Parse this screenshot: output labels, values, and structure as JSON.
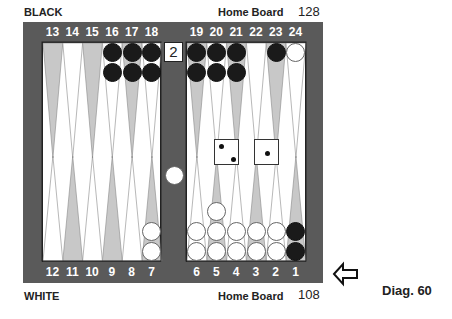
{
  "labels": {
    "top_player": "BLACK",
    "top_home": "Home Board",
    "top_pipcount": "128",
    "bottom_player": "WHITE",
    "bottom_home": "Home Board",
    "bottom_pipcount": "108",
    "diagram": "Diag. 60"
  },
  "colors": {
    "frame": "#5a5a5a",
    "dark_point": "#c8c8c8",
    "light_point": "#ffffff",
    "black": "#1a1a1a",
    "white": "#ffffff"
  },
  "top_numbers": [
    "13",
    "14",
    "15",
    "16",
    "17",
    "18",
    "19",
    "20",
    "21",
    "22",
    "23",
    "24"
  ],
  "bottom_numbers": [
    "12",
    "11",
    "10",
    "9",
    "8",
    "7",
    "6",
    "5",
    "4",
    "3",
    "2",
    "1"
  ],
  "cube": {
    "value": "2",
    "position": "bar-top"
  },
  "dice": [
    2,
    1
  ],
  "bar": {
    "white": 1,
    "black": 0
  },
  "points": {
    "1": {
      "color": "black",
      "count": 2
    },
    "2": {
      "color": "white",
      "count": 2
    },
    "3": {
      "color": "white",
      "count": 2
    },
    "4": {
      "color": "white",
      "count": 2
    },
    "5": {
      "color": "white",
      "count": 3
    },
    "6": {
      "color": "white",
      "count": 2
    },
    "7": {
      "color": "white",
      "count": 2
    },
    "16": {
      "color": "black",
      "count": 2
    },
    "17": {
      "color": "black",
      "count": 2
    },
    "18": {
      "color": "black",
      "count": 2
    },
    "19": {
      "color": "black",
      "count": 2
    },
    "20": {
      "color": "black",
      "count": 2
    },
    "21": {
      "color": "black",
      "count": 2
    },
    "23": {
      "color": "black",
      "count": 1
    },
    "24": {
      "color": "white",
      "count": 1
    }
  },
  "arrow": {
    "icon": "left-arrow-icon",
    "direction": "left"
  }
}
